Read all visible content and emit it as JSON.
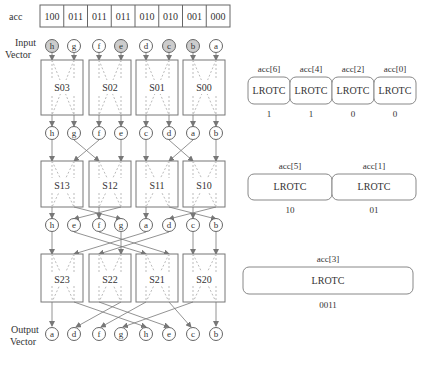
{
  "acc_row": {
    "label": "acc",
    "cells": [
      "100",
      "011",
      "011",
      "011",
      "010",
      "010",
      "001",
      "000"
    ]
  },
  "input_vector": {
    "label_line1": "Input",
    "label_line2": "Vector",
    "nodes": [
      {
        "v": "h",
        "shaded": true
      },
      {
        "v": "g",
        "shaded": false
      },
      {
        "v": "f",
        "shaded": false
      },
      {
        "v": "e",
        "shaded": true
      },
      {
        "v": "d",
        "shaded": false
      },
      {
        "v": "c",
        "shaded": true
      },
      {
        "v": "b",
        "shaded": true
      },
      {
        "v": "a",
        "shaded": false
      }
    ]
  },
  "stage0": {
    "switches": [
      "S03",
      "S02",
      "S01",
      "S00"
    ]
  },
  "stage1_nodes": [
    "h",
    "g",
    "f",
    "e",
    "c",
    "d",
    "a",
    "b"
  ],
  "stage1": {
    "switches": [
      "S13",
      "S12",
      "S11",
      "S10"
    ]
  },
  "stage2_nodes": [
    "h",
    "e",
    "f",
    "g",
    "a",
    "d",
    "c",
    "b"
  ],
  "stage2": {
    "switches": [
      "S23",
      "S22",
      "S21",
      "S20"
    ]
  },
  "output_vector": {
    "label_line1": "Output",
    "label_line2": "Vector",
    "nodes": [
      "a",
      "d",
      "f",
      "g",
      "h",
      "e",
      "c",
      "b"
    ]
  },
  "lrotc_stage0": {
    "units": [
      {
        "acc": "acc[6]",
        "label": "LROTC",
        "out": "1"
      },
      {
        "acc": "acc[4]",
        "label": "LROTC",
        "out": "1"
      },
      {
        "acc": "acc[2]",
        "label": "LROTC",
        "out": "0"
      },
      {
        "acc": "acc[0]",
        "label": "LROTC",
        "out": "0"
      }
    ]
  },
  "lrotc_stage1": {
    "units": [
      {
        "acc": "acc[5]",
        "label": "LROTC",
        "out": "10"
      },
      {
        "acc": "acc[1]",
        "label": "LROTC",
        "out": "01"
      }
    ]
  },
  "lrotc_stage2": {
    "units": [
      {
        "acc": "acc[3]",
        "label": "LROTC",
        "out": "0011"
      }
    ]
  },
  "colors": {
    "line": "#666666",
    "dash": "#aaaaaa",
    "shade": "#cccccc",
    "box": "#777777"
  }
}
